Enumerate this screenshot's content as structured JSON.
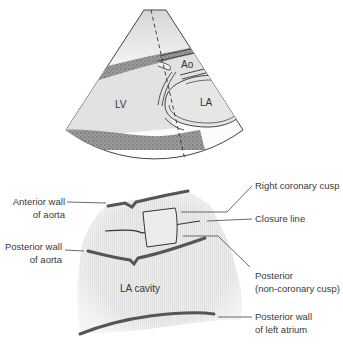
{
  "figure": {
    "upper_panel": {
      "description": "Parasternal long-axis echocardiographic sector with M-mode cursor line",
      "labels": {
        "ao": "Ao",
        "lv": "LV",
        "la": "LA"
      }
    },
    "lower_panel": {
      "description": "M-mode trace through aortic root and left atrium",
      "inner_label": "LA cavity",
      "left_labels": [
        {
          "line1": "Anterior wall",
          "line2": "of aorta"
        },
        {
          "line1": "Posterior wall",
          "line2": "of aorta"
        }
      ],
      "right_labels": [
        {
          "line1": "Right coronary cusp",
          "line2": ""
        },
        {
          "line1": "Closure line",
          "line2": ""
        },
        {
          "line1": "Posterior",
          "line2": "(non-coronary cusp)"
        },
        {
          "line1": "Posterior wall",
          "line2": "of left atrium"
        }
      ]
    },
    "colors": {
      "sector_fill": "#e6e6e6",
      "wall_dark": "#555555",
      "myocardium_stipple": "#8a8a8a",
      "label_text": "#3a3a3a",
      "leader_line": "#444444"
    }
  }
}
